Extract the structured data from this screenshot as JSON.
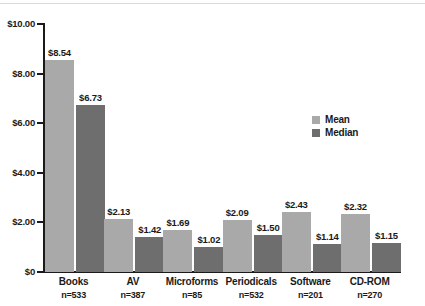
{
  "chart_data": {
    "type": "bar",
    "title": "",
    "xlabel": "",
    "ylabel": "",
    "ylim": [
      0,
      10
    ],
    "grid": false,
    "legend_position": "right",
    "categories": [
      "Books",
      "AV",
      "Microforms",
      "Periodicals",
      "Software",
      "CD-ROM"
    ],
    "category_sublabels": [
      "n=533",
      "n=387",
      "n=85",
      "n=532",
      "n=201",
      "n=270"
    ],
    "series": [
      {
        "name": "Mean",
        "color": "#a9a9a9",
        "values": [
          8.54,
          2.13,
          1.69,
          2.09,
          2.43,
          2.32
        ],
        "value_labels": [
          "$8.54",
          "$2.13",
          "$1.69",
          "$2.09",
          "$2.43",
          "$2.32"
        ]
      },
      {
        "name": "Median",
        "color": "#6e6e6e",
        "values": [
          6.73,
          1.42,
          1.02,
          1.5,
          1.14,
          1.15
        ],
        "value_labels": [
          "$6.73",
          "$1.42",
          "$1.02",
          "$1.50",
          "$1.14",
          "$1.15"
        ]
      }
    ],
    "y_ticks": [
      10,
      8,
      6,
      4,
      2,
      0
    ],
    "y_tick_labels": [
      "$10.00",
      "$8.00",
      "$6.00",
      "$4.00",
      "$2.00",
      "$0"
    ]
  },
  "legend": {
    "items": [
      {
        "label": "Mean"
      },
      {
        "label": "Median"
      }
    ]
  }
}
